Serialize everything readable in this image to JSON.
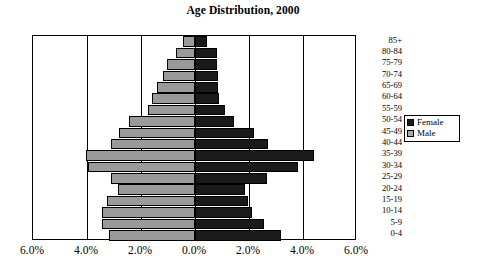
{
  "chart_data": {
    "type": "bar",
    "subtype": "population-pyramid",
    "title": "Age Distribution, 2000",
    "xlabel": "",
    "ylabel": "",
    "categories": [
      "85+",
      "80-84",
      "75-79",
      "70-74",
      "65-69",
      "60-64",
      "55-59",
      "50-54",
      "45-49",
      "40-44",
      "35-39",
      "30-34",
      "25-29",
      "20-24",
      "15-19",
      "10-14",
      "5-9",
      "0-4"
    ],
    "series": [
      {
        "name": "Male",
        "side": "left",
        "color": "#9a9a9a",
        "values": [
          0.45,
          0.7,
          1.05,
          1.2,
          1.4,
          1.6,
          1.75,
          2.45,
          2.8,
          3.1,
          4.05,
          3.95,
          3.1,
          2.85,
          3.25,
          3.45,
          3.45,
          3.2
        ]
      },
      {
        "name": "Female",
        "side": "right",
        "color": "#1a1a1a",
        "values": [
          0.45,
          0.8,
          0.8,
          0.85,
          0.85,
          0.9,
          1.1,
          1.45,
          2.2,
          2.7,
          4.4,
          3.8,
          2.65,
          1.85,
          1.95,
          2.1,
          2.55,
          3.2
        ]
      }
    ],
    "xticks": [
      "6.0%",
      "4.0%",
      "2.0%",
      "0.0%",
      "2.0%",
      "4.0%",
      "6.0%"
    ],
    "xtick_values": [
      -6,
      -4,
      -2,
      0,
      2,
      4,
      6
    ],
    "xlim": [
      -6,
      6
    ],
    "unit": "%",
    "grid": true,
    "grid_axis": "x",
    "legend": {
      "position": "right",
      "entries": [
        {
          "label": "Female",
          "swatch": "female-swatch"
        },
        {
          "label": "Male",
          "swatch": "male-swatch"
        }
      ]
    }
  }
}
